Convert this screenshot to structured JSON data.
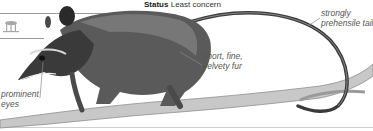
{
  "status": {
    "label": "Status",
    "value": "Least concern"
  },
  "annotations": {
    "tail": [
      "strongly",
      "prehensile tail"
    ],
    "fur": [
      "short, fine,",
      "velvety fur"
    ],
    "eyes": [
      "prominent",
      "eyes"
    ]
  },
  "icons": {
    "habitat": "tree-habitat-icon"
  },
  "colors": {
    "rule": "#9a9a9a",
    "label_text": "#555555",
    "animal_dark": "#2a2a2a",
    "animal_mid": "#6e6e6e",
    "branch": "#bdbdbd"
  }
}
